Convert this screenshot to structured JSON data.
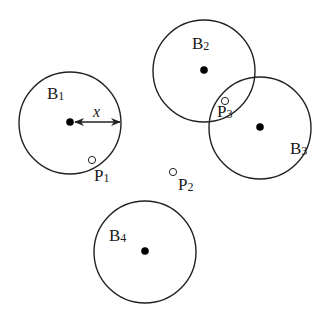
{
  "diagram": {
    "type": "coverage-circles",
    "stroke_color": "#222222",
    "dot_color": "#000000",
    "circles": [
      {
        "id": "B1",
        "letter": "B",
        "index": "1",
        "cx": 70,
        "cy": 123,
        "r": 51,
        "label_x": 47,
        "label_y": 99
      },
      {
        "id": "B2",
        "letter": "B",
        "index": "2",
        "cx": 204,
        "cy": 71,
        "r": 51,
        "label_x": 192,
        "label_y": 49
      },
      {
        "id": "B3",
        "letter": "B",
        "index": "3",
        "cx": 260,
        "cy": 128,
        "r": 51,
        "label_x": 290,
        "label_y": 154
      },
      {
        "id": "B4",
        "letter": "B",
        "index": "4",
        "cx": 145,
        "cy": 252,
        "r": 51,
        "label_x": 109,
        "label_y": 241
      }
    ],
    "points": [
      {
        "id": "P1",
        "letter": "P",
        "index": "1",
        "x": 92,
        "y": 160,
        "label_x": 94,
        "label_y": 181
      },
      {
        "id": "P2",
        "letter": "P",
        "index": "2",
        "x": 173,
        "y": 172,
        "label_x": 178,
        "label_y": 190
      },
      {
        "id": "P3",
        "letter": "P",
        "index": "3",
        "x": 225,
        "y": 101,
        "label_x": 217,
        "label_y": 117
      }
    ],
    "radius_arrow": {
      "label": "x",
      "from_x": 70,
      "from_y": 122,
      "to_x": 120,
      "to_y": 122,
      "label_x": 93,
      "label_y": 117
    }
  }
}
